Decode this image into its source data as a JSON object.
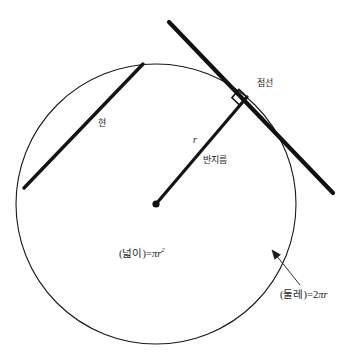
{
  "figure": {
    "background": "#ffffff",
    "stroke_color": "#1a1a1a",
    "labels": {
      "chord": "현",
      "tangent": "접선",
      "radius_symbol": "r",
      "radius_text": "반지름",
      "area_prefix": "(넓이)=",
      "area_pi": "π",
      "area_var": "r",
      "area_exponent": "2",
      "circumference_prefix": "(둘레)=",
      "circumference_coefficient": "2",
      "circumference_pi": "π",
      "circumference_var": "r"
    }
  },
  "chart_data": {
    "type": "diagram",
    "canvas": {
      "width": 362,
      "height": 364
    },
    "circle": {
      "center": [
        156,
        204
      ],
      "radius": 140,
      "stroke_width": 1.1,
      "fill": "none"
    },
    "center_point": {
      "position": [
        156,
        204
      ],
      "radius": 3.6,
      "fill": "#111111"
    },
    "segments": [
      {
        "name": "chord",
        "label": "현",
        "from": [
          24,
          188
        ],
        "to": [
          143,
          64
        ],
        "stroke_width": 3.4
      },
      {
        "name": "radius",
        "label": "반지름",
        "symbol": "r",
        "from": [
          156,
          204
        ],
        "to": [
          247,
          97
        ],
        "stroke_width": 3.2
      },
      {
        "name": "tangent",
        "label": "접선",
        "from": [
          169,
          22
        ],
        "to": [
          333,
          193
        ],
        "stroke_width": 4.2,
        "touch_point": [
          247,
          97
        ]
      }
    ],
    "right_angle_marker": {
      "at": [
        247,
        97
      ],
      "size": 11,
      "between": [
        "radius",
        "tangent"
      ],
      "angle_degrees": 90
    },
    "callout_arrow": {
      "name": "circumference-pointer",
      "from": [
        300,
        285
      ],
      "to": [
        272,
        250
      ],
      "head": "arrow",
      "stroke_width": 0.9
    },
    "annotations": [
      {
        "name": "chord-label",
        "text": "현",
        "at": [
          98,
          119
        ]
      },
      {
        "name": "tangent-label",
        "text": "접선",
        "at": [
          257,
          79
        ]
      },
      {
        "name": "radius-symbol-label",
        "text": "r",
        "at": [
          193,
          135
        ]
      },
      {
        "name": "radius-label",
        "text": "반지름",
        "at": [
          203,
          156
        ]
      },
      {
        "name": "area-formula",
        "text": "(넓이)=πr²",
        "at": [
          119,
          247
        ]
      },
      {
        "name": "circumference-formula",
        "text": "(둘레)=2πr",
        "at": [
          280,
          290
        ]
      }
    ]
  }
}
